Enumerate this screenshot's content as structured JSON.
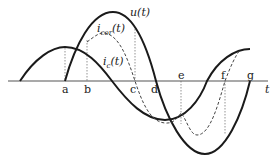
{
  "diagram": {
    "title": "",
    "axis": {
      "label": "t",
      "y": 81,
      "x_start": 8,
      "x_end": 268
    },
    "points": [
      {
        "id": "a",
        "label": "a",
        "x": 65
      },
      {
        "id": "b",
        "label": "b",
        "x": 87
      },
      {
        "id": "c",
        "label": "c",
        "x": 135
      },
      {
        "id": "d",
        "label": "d",
        "x": 156
      },
      {
        "id": "e",
        "label": "e",
        "x": 181
      },
      {
        "id": "f",
        "label": "f",
        "x": 225
      },
      {
        "id": "g",
        "label": "g",
        "x": 250
      }
    ],
    "curves": [
      {
        "id": "u",
        "label_main": "u",
        "label_sub": "",
        "label_tail": "(t)",
        "style": "solid-thick"
      },
      {
        "id": "i_cor",
        "label_main": "i",
        "label_sub": "cor",
        "label_tail": "(t)",
        "style": "dashed"
      },
      {
        "id": "i_c",
        "label_main": "i",
        "label_sub": "c",
        "label_tail": "(t)",
        "style": "solid-thick"
      }
    ],
    "colors": {
      "line": "#1a1a1a",
      "axis": "#555555",
      "guide": "#666666"
    }
  }
}
